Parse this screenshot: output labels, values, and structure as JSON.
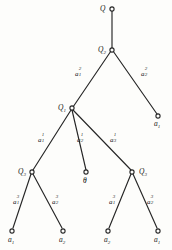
{
  "figure": {
    "type": "game-tree-diagram",
    "stroke_color": "#262626",
    "background_color": "#fdfdfb",
    "width": 172,
    "height": 250
  },
  "nodes": {
    "root": {
      "label": "Q",
      "sub": "",
      "x": 112,
      "y": 9
    },
    "q2": {
      "label": "Q",
      "sub": "2",
      "x": 112,
      "y": 50
    },
    "q1": {
      "label": "Q",
      "sub": "1",
      "x": 72,
      "y": 108
    },
    "leaf_right_top": {
      "label": "a",
      "sub": "1",
      "x": 158,
      "y": 116
    },
    "q3_left": {
      "label": "Q",
      "sub": "3",
      "x": 32,
      "y": 172
    },
    "theta": {
      "label": "θ",
      "sub": "",
      "x": 86,
      "y": 172
    },
    "q3_right": {
      "label": "Q",
      "sub": "3",
      "x": 132,
      "y": 172
    },
    "leaf_1": {
      "label": "a",
      "sub": "1",
      "x": 12,
      "y": 231
    },
    "leaf_2": {
      "label": "a",
      "sub": "2",
      "x": 63,
      "y": 231
    },
    "leaf_3": {
      "label": "a",
      "sub": "2",
      "x": 108,
      "y": 231
    },
    "leaf_4": {
      "label": "a",
      "sub": "1",
      "x": 158,
      "y": 231
    }
  },
  "edges": [
    {
      "name": "root-to-q2",
      "from": "root",
      "to": "q2",
      "label": "",
      "sub": "",
      "sup": ""
    },
    {
      "name": "q2-to-q1",
      "from": "q2",
      "to": "q1",
      "label": "a",
      "sub": "1",
      "sup": "2"
    },
    {
      "name": "q2-to-leaf-a1",
      "from": "q2",
      "to": "leaf_right_top",
      "label": "a",
      "sub": "2",
      "sup": "2"
    },
    {
      "name": "q1-to-q3-left",
      "from": "q1",
      "to": "q3_left",
      "label": "a",
      "sub": "1",
      "sup": "1"
    },
    {
      "name": "q1-to-theta",
      "from": "q1",
      "to": "theta",
      "label": "a",
      "sub": "2",
      "sup": "1"
    },
    {
      "name": "q1-to-q3-right",
      "from": "q1",
      "to": "q3_right",
      "label": "a",
      "sub": "3",
      "sup": "1"
    },
    {
      "name": "q3left-to-leaf1",
      "from": "q3_left",
      "to": "leaf_1",
      "label": "a",
      "sub": "1",
      "sup": "3"
    },
    {
      "name": "q3left-to-leaf2",
      "from": "q3_left",
      "to": "leaf_2",
      "label": "a",
      "sub": "2",
      "sup": "3"
    },
    {
      "name": "q3right-to-leaf3",
      "from": "q3_right",
      "to": "leaf_3",
      "label": "a",
      "sub": "1",
      "sup": "3"
    },
    {
      "name": "q3right-to-leaf4",
      "from": "q3_right",
      "to": "leaf_4",
      "label": "a",
      "sub": "2",
      "sup": "3"
    }
  ],
  "labels": {
    "root": {
      "base": "Q",
      "sub": ""
    },
    "q2": {
      "base": "Q",
      "sub": "2"
    },
    "q1": {
      "base": "Q",
      "sub": "1"
    },
    "q3_left": {
      "base": "Q",
      "sub": "3"
    },
    "q3_right": {
      "base": "Q",
      "sub": "3"
    },
    "theta": {
      "base": "θ",
      "sub": ""
    },
    "leaf_right_top": {
      "base": "a",
      "sub": "1"
    },
    "leaf_1": {
      "base": "a",
      "sub": "1"
    },
    "leaf_2": {
      "base": "a",
      "sub": "2"
    },
    "leaf_3": {
      "base": "a",
      "sub": "2"
    },
    "leaf_4": {
      "base": "a",
      "sub": "1"
    },
    "e_q2_q1": {
      "base": "a",
      "sub": "1",
      "sup": "2"
    },
    "e_q2_leaf": {
      "base": "a",
      "sub": "2",
      "sup": "2"
    },
    "e_q1_q3l": {
      "base": "a",
      "sub": "1",
      "sup": "1"
    },
    "e_q1_theta": {
      "base": "a",
      "sub": "2",
      "sup": "1"
    },
    "e_q1_q3r": {
      "base": "a",
      "sub": "3",
      "sup": "1"
    },
    "e_q3l_l1": {
      "base": "a",
      "sub": "1",
      "sup": "3"
    },
    "e_q3l_l2": {
      "base": "a",
      "sub": "2",
      "sup": "3"
    },
    "e_q3r_l3": {
      "base": "a",
      "sub": "1",
      "sup": "3"
    },
    "e_q3r_l4": {
      "base": "a",
      "sub": "2",
      "sup": "3"
    }
  }
}
